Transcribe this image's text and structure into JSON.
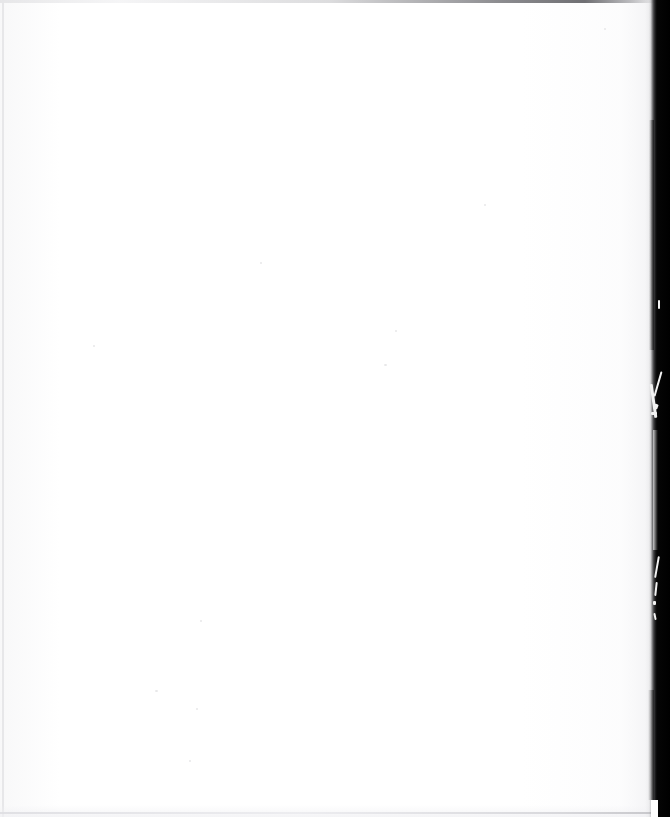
{
  "document": {
    "kind": "scanned-page",
    "content_state": "blank",
    "page_text": "",
    "caption": "Blank scanned page",
    "dimensions": {
      "width_px": 670,
      "height_px": 817
    }
  },
  "colors": {
    "paper": "#ffffff",
    "gutter_shadow": "#000000",
    "gutter_edge_soft": "#4a4a4c",
    "edge_rule": "#e6e6e8",
    "top_rule_dark": "#606064",
    "fiber_highlight": "#f2f2f2",
    "speck": "#e4e4e6"
  },
  "regions": {
    "paper_field": {
      "label": "Blank paper area",
      "x": 0,
      "y": 0,
      "width": 651,
      "height": 817
    },
    "gutter_band": {
      "label": "Dark book-gutter edge shadow",
      "x": 651,
      "y": 0,
      "width": 19,
      "height": 817
    },
    "top_edge_line": {
      "label": "Faint top edge rule",
      "x": 0,
      "y": 0,
      "width": 670,
      "height": 3
    },
    "left_edge_line": {
      "label": "Faint left edge rule",
      "x": 2,
      "y": 0,
      "width": 2,
      "height": 817
    },
    "bottom_edge_line": {
      "label": "Faint bottom edge rule",
      "x": 0,
      "y": 812,
      "width": 652,
      "height": 2
    }
  },
  "artifacts": {
    "fibers": [
      {
        "name": "paper-fiber-streak",
        "x": 657,
        "y": 371
      },
      {
        "name": "paper-fiber-streak",
        "x": 652,
        "y": 384
      },
      {
        "name": "paper-tear-fleck",
        "x": 654,
        "y": 404
      },
      {
        "name": "paper-tear-fleck",
        "x": 651,
        "y": 412
      },
      {
        "name": "paper-fiber-streak",
        "x": 656,
        "y": 556
      },
      {
        "name": "paper-fiber-streak",
        "x": 655,
        "y": 582
      },
      {
        "name": "paper-tear-fleck",
        "x": 653,
        "y": 601
      },
      {
        "name": "paper-fiber-streak",
        "x": 654,
        "y": 613
      },
      {
        "name": "paper-fiber-streak",
        "x": 658,
        "y": 300
      }
    ],
    "specks": [
      {
        "x": 260,
        "y": 262
      },
      {
        "x": 395,
        "y": 330
      },
      {
        "x": 384,
        "y": 364
      },
      {
        "x": 484,
        "y": 204
      },
      {
        "x": 200,
        "y": 620
      },
      {
        "x": 155,
        "y": 690
      },
      {
        "x": 196,
        "y": 708
      },
      {
        "x": 93,
        "y": 345
      },
      {
        "x": 604,
        "y": 28
      },
      {
        "x": 189,
        "y": 760
      }
    ]
  }
}
